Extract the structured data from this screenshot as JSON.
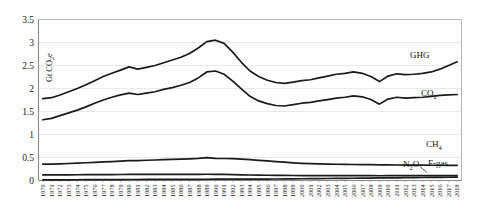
{
  "chart_data": {
    "type": "line",
    "title": "",
    "xlabel": "",
    "ylabel": "Gt CO2e",
    "ylabel_display": "Gt CO",
    "ylabel_sub": "2",
    "ylabel_tail": "e",
    "ylim": [
      0,
      3.5
    ],
    "ytick_step": 0.5,
    "yticks": [
      "0",
      "0.5",
      "1",
      "1.5",
      "2",
      "2.5",
      "3",
      "3.5"
    ],
    "grid": true,
    "grid_orientation": "horizontal",
    "grid_color": "#e3e3e3",
    "legend_position": "inline-right-annotations",
    "line_color": "#1a1a1a",
    "categories": [
      "1970",
      "1971",
      "1972",
      "1973",
      "1974",
      "1975",
      "1976",
      "1977",
      "1978",
      "1979",
      "1980",
      "1981",
      "1982",
      "1983",
      "1984",
      "1985",
      "1986",
      "1987",
      "1988",
      "1989",
      "1990",
      "1991",
      "1992",
      "1993",
      "1994",
      "1995",
      "1996",
      "1997",
      "1998",
      "1999",
      "2000",
      "2001",
      "2002",
      "2003",
      "2004",
      "2005",
      "2006",
      "2007",
      "2008",
      "2009",
      "2010",
      "2011",
      "2012",
      "2013",
      "2014",
      "2015",
      "2016",
      "2017",
      "2018"
    ],
    "series": [
      {
        "name": "GHG",
        "label": "GHG",
        "values": [
          1.78,
          1.8,
          1.86,
          1.93,
          2.0,
          2.08,
          2.17,
          2.26,
          2.33,
          2.4,
          2.47,
          2.42,
          2.46,
          2.5,
          2.56,
          2.62,
          2.68,
          2.76,
          2.88,
          3.02,
          3.05,
          2.98,
          2.79,
          2.57,
          2.38,
          2.26,
          2.18,
          2.13,
          2.11,
          2.14,
          2.17,
          2.19,
          2.23,
          2.27,
          2.31,
          2.33,
          2.36,
          2.33,
          2.26,
          2.15,
          2.27,
          2.32,
          2.3,
          2.31,
          2.33,
          2.36,
          2.42,
          2.5,
          2.58
        ]
      },
      {
        "name": "CO2",
        "label": "CO",
        "label_sub": "2",
        "values": [
          1.32,
          1.35,
          1.41,
          1.47,
          1.53,
          1.6,
          1.68,
          1.75,
          1.81,
          1.86,
          1.9,
          1.87,
          1.9,
          1.93,
          1.98,
          2.02,
          2.07,
          2.13,
          2.23,
          2.36,
          2.38,
          2.31,
          2.16,
          1.99,
          1.83,
          1.73,
          1.67,
          1.63,
          1.62,
          1.65,
          1.68,
          1.7,
          1.73,
          1.76,
          1.79,
          1.81,
          1.84,
          1.82,
          1.76,
          1.66,
          1.77,
          1.81,
          1.79,
          1.8,
          1.81,
          1.83,
          1.85,
          1.86,
          1.87
        ]
      },
      {
        "name": "CH4",
        "label": "CH",
        "label_sub": "4",
        "values": [
          0.355,
          0.358,
          0.363,
          0.37,
          0.378,
          0.386,
          0.394,
          0.403,
          0.412,
          0.421,
          0.43,
          0.434,
          0.44,
          0.446,
          0.452,
          0.458,
          0.463,
          0.47,
          0.48,
          0.497,
          0.48,
          0.478,
          0.474,
          0.465,
          0.452,
          0.438,
          0.425,
          0.412,
          0.398,
          0.385,
          0.374,
          0.366,
          0.36,
          0.356,
          0.353,
          0.35,
          0.348,
          0.345,
          0.343,
          0.34,
          0.338,
          0.337,
          0.335,
          0.334,
          0.333,
          0.332,
          0.331,
          0.33,
          0.33
        ]
      },
      {
        "name": "N2O",
        "label": "N",
        "label_sub": "2",
        "label_tail": "O",
        "values": [
          0.122,
          0.122,
          0.123,
          0.124,
          0.125,
          0.126,
          0.127,
          0.128,
          0.129,
          0.13,
          0.131,
          0.131,
          0.132,
          0.132,
          0.133,
          0.133,
          0.134,
          0.134,
          0.135,
          0.136,
          0.134,
          0.132,
          0.128,
          0.124,
          0.12,
          0.117,
          0.114,
          0.112,
          0.11,
          0.109,
          0.108,
          0.107,
          0.106,
          0.106,
          0.105,
          0.105,
          0.105,
          0.104,
          0.104,
          0.103,
          0.104,
          0.104,
          0.104,
          0.104,
          0.104,
          0.104,
          0.104,
          0.104,
          0.104
        ]
      },
      {
        "name": "F-gas",
        "label": "F-gas",
        "values": [
          0.012,
          0.013,
          0.014,
          0.015,
          0.016,
          0.017,
          0.018,
          0.019,
          0.02,
          0.021,
          0.022,
          0.022,
          0.023,
          0.023,
          0.024,
          0.024,
          0.025,
          0.025,
          0.026,
          0.027,
          0.028,
          0.028,
          0.029,
          0.029,
          0.03,
          0.031,
          0.032,
          0.033,
          0.034,
          0.036,
          0.038,
          0.039,
          0.041,
          0.043,
          0.045,
          0.047,
          0.049,
          0.051,
          0.053,
          0.055,
          0.057,
          0.059,
          0.061,
          0.063,
          0.065,
          0.067,
          0.069,
          0.071,
          0.073
        ]
      }
    ],
    "annotations": [
      {
        "name": "ghg-label",
        "text": "GHG"
      },
      {
        "name": "co2-label",
        "text": "CO2"
      },
      {
        "name": "ch4-label",
        "text": "CH4"
      },
      {
        "name": "n2o-label",
        "text": "N2O"
      },
      {
        "name": "fgas-label",
        "text": "F-gas"
      }
    ]
  }
}
